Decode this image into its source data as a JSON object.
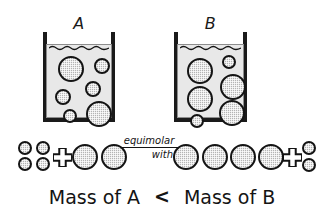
{
  "figure": {
    "type": "chemistry-concept-diagram",
    "caption": {
      "left": "Mass of A",
      "relation": "<",
      "right": "Mass of B"
    },
    "relation_note": {
      "line1": "equimolar",
      "line2": "with"
    },
    "plus_symbol": "+",
    "colors": {
      "ink": "#141414",
      "particle_fill": "#b4b4b4",
      "liquid_fill": "#e8e8e8",
      "background": "#ffffff"
    }
  },
  "beakers": [
    {
      "label": "A",
      "name": "beaker-a",
      "x": 43,
      "y": 18,
      "w": 72,
      "h": 104,
      "liquid_height": 74,
      "particles": [
        {
          "cx": 24,
          "cy": 24,
          "r": 13
        },
        {
          "cx": 55,
          "cy": 21,
          "r": 8
        },
        {
          "cx": 46,
          "cy": 44,
          "r": 8
        },
        {
          "cx": 16,
          "cy": 52,
          "r": 8
        },
        {
          "cx": 23,
          "cy": 71,
          "r": 7
        },
        {
          "cx": 52,
          "cy": 69,
          "r": 13
        }
      ]
    },
    {
      "label": "B",
      "name": "beaker-b",
      "x": 174,
      "y": 18,
      "w": 73,
      "h": 104,
      "liquid_height": 74,
      "particles": [
        {
          "cx": 22,
          "cy": 26,
          "r": 13
        },
        {
          "cx": 51,
          "cy": 17,
          "r": 7
        },
        {
          "cx": 55,
          "cy": 42,
          "r": 13
        },
        {
          "cx": 22,
          "cy": 54,
          "r": 13
        },
        {
          "cx": 54,
          "cy": 68,
          "r": 13
        },
        {
          "cx": 19,
          "cy": 76,
          "r": 7
        }
      ]
    }
  ],
  "equation_row": {
    "left_group": {
      "name": "solute-particles-a",
      "small_circles": [
        {
          "cx": 25,
          "cy": 148,
          "r": 7
        },
        {
          "cx": 43,
          "cy": 148,
          "r": 7
        },
        {
          "cx": 25,
          "cy": 164,
          "r": 7
        },
        {
          "cx": 43,
          "cy": 164,
          "r": 7
        }
      ],
      "plus": {
        "cx": 62,
        "cy": 157,
        "size": 19
      },
      "large_circles": [
        {
          "cx": 85,
          "cy": 157,
          "r": 13
        },
        {
          "cx": 114,
          "cy": 157,
          "r": 13
        }
      ]
    },
    "right_group": {
      "name": "solute-particles-b",
      "large_circles": [
        {
          "cx": 186,
          "cy": 157,
          "r": 13
        },
        {
          "cx": 215,
          "cy": 157,
          "r": 13
        },
        {
          "cx": 243,
          "cy": 157,
          "r": 13
        },
        {
          "cx": 271,
          "cy": 157,
          "r": 13
        }
      ],
      "plus": {
        "cx": 292,
        "cy": 157,
        "size": 19
      },
      "small_circles": [
        {
          "cx": 309,
          "cy": 148,
          "r": 7
        },
        {
          "cx": 309,
          "cy": 165,
          "r": 7
        }
      ]
    },
    "note": {
      "cx": 149,
      "cy": 152
    }
  }
}
